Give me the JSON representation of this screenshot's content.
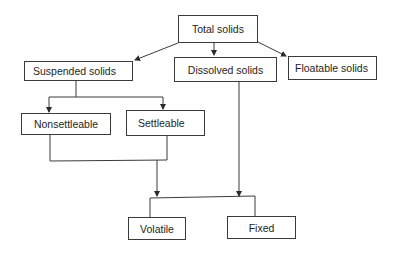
{
  "diagram": {
    "type": "hierarchy",
    "nodes": [
      {
        "id": "total",
        "label": "Total solids"
      },
      {
        "id": "suspended",
        "label": "Suspended solids"
      },
      {
        "id": "dissolved",
        "label": "Dissolved solids"
      },
      {
        "id": "floatable",
        "label": "Floatable solids"
      },
      {
        "id": "nonsettleable",
        "label": "Nonsettleable"
      },
      {
        "id": "settleable",
        "label": "Settleable"
      },
      {
        "id": "volatile",
        "label": "Volatile"
      },
      {
        "id": "fixed",
        "label": "Fixed"
      }
    ],
    "edges": [
      {
        "from": "total",
        "to": "suspended"
      },
      {
        "from": "total",
        "to": "dissolved"
      },
      {
        "from": "total",
        "to": "floatable"
      },
      {
        "from": "suspended",
        "to": "nonsettleable"
      },
      {
        "from": "suspended",
        "to": "settleable"
      },
      {
        "from": "nonsettleable",
        "to": "volatile"
      },
      {
        "from": "settleable",
        "to": "volatile"
      },
      {
        "from": "dissolved",
        "to": "fixed"
      }
    ]
  },
  "colors": {
    "line": "#3a3a3a",
    "text": "#1e1e1e",
    "background": "#ffffff"
  }
}
